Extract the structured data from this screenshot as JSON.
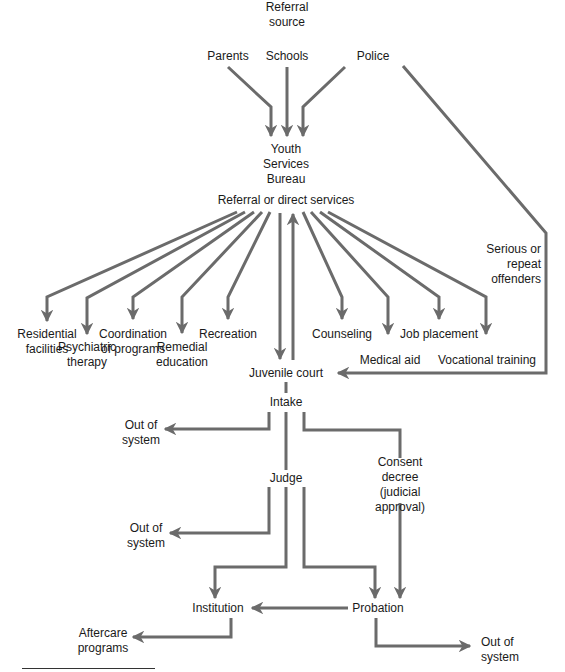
{
  "diagram": {
    "type": "flowchart",
    "colors": {
      "line": "#6b6b6b",
      "text": "#1a1a1a",
      "background": "#ffffff"
    },
    "nodes": {
      "referral_source": "Referral\nsource",
      "parents": "Parents",
      "schools": "Schools",
      "police": "Police",
      "ysb": "Youth\nServices\nBureau",
      "referral_direct": "Referral or direct services",
      "residential": "Residential\nfacilities",
      "psychiatric": "Psychiatric\ntherapy",
      "coordination": "Coordination\nof programs",
      "remedial": "Remedial\neducation",
      "recreation": "Recreation",
      "counseling": "Counseling",
      "medical": "Medical aid",
      "job": "Job placement",
      "vocational": "Vocational training",
      "serious": "Serious or\nrepeat\noffenders",
      "juvenile_court": "Juvenile court",
      "intake": "Intake",
      "out1": "Out of\nsystem",
      "consent": "Consent\ndecree\n(judicial\napproval)",
      "judge": "Judge",
      "out2": "Out of\nsystem",
      "institution": "Institution",
      "probation": "Probation",
      "aftercare": "Aftercare\nprograms",
      "out3": "Out of\nsystem"
    },
    "edges": [
      [
        "parents",
        "ysb"
      ],
      [
        "schools",
        "ysb"
      ],
      [
        "police",
        "ysb"
      ],
      [
        "police",
        "juvenile_court",
        "Serious or repeat offenders"
      ],
      [
        "referral_direct",
        "residential"
      ],
      [
        "referral_direct",
        "psychiatric"
      ],
      [
        "referral_direct",
        "coordination"
      ],
      [
        "referral_direct",
        "remedial"
      ],
      [
        "referral_direct",
        "recreation"
      ],
      [
        "referral_direct",
        "juvenile_court"
      ],
      [
        "juvenile_court",
        "referral_direct"
      ],
      [
        "referral_direct",
        "counseling"
      ],
      [
        "referral_direct",
        "medical"
      ],
      [
        "referral_direct",
        "job"
      ],
      [
        "referral_direct",
        "vocational"
      ],
      [
        "intake",
        "out1"
      ],
      [
        "intake",
        "judge"
      ],
      [
        "intake",
        "consent"
      ],
      [
        "consent",
        "probation"
      ],
      [
        "judge",
        "out2"
      ],
      [
        "judge",
        "institution"
      ],
      [
        "judge",
        "probation"
      ],
      [
        "probation",
        "institution"
      ],
      [
        "probation",
        "out3"
      ],
      [
        "institution",
        "aftercare"
      ]
    ]
  }
}
